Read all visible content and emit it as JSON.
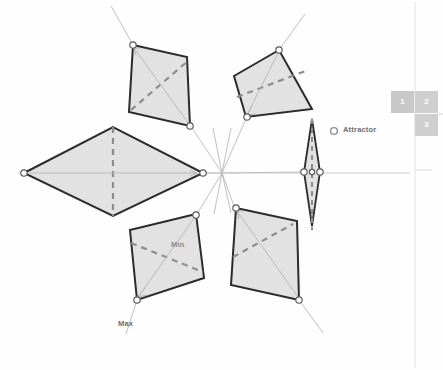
{
  "canvas": {
    "width": 443,
    "height": 370,
    "background": "#fefefe"
  },
  "legend": {
    "attractor_label": "Attractor",
    "attractor_icon": "circle-node-icon"
  },
  "annotations": {
    "min_label": "Min",
    "max_label": "Max"
  },
  "panel_boxes": {
    "items": [
      {
        "label": "1",
        "color": "#c8c8c8"
      },
      {
        "label": "2",
        "color": "#cfcfcf"
      },
      {
        "label": "3",
        "color": "#cfcfcf"
      }
    ]
  },
  "colors": {
    "panel_fill": "#e2e2e2",
    "panel_stroke": "#2b2b2b",
    "dashed_diagonal": "#8d8d8d",
    "thin_guide": "#b7b7b7",
    "node_stroke": "#555555",
    "node_fill": "#ffffff",
    "axis_line": "#c9c9c9",
    "ui_divider": "#e6e6e6",
    "text_gray": "#6e6e6e"
  },
  "geometry": {
    "center": {
      "x": 222,
      "y": 173
    },
    "symmetry": 5,
    "panels": [
      {
        "name": "panel-left-kite",
        "points": "24,173 113,127 203,173 113,216",
        "dashed": "113,127 113,216",
        "guide": "24,173 203,173",
        "arrow_at": "190,170"
      },
      {
        "name": "panel-top-left-square",
        "points": "133,45 186,58 190,126 130,112",
        "dashed": "133,112 190,58",
        "guide": "133,45 190,126",
        "arrow_at": "145,60"
      },
      {
        "name": "panel-top-right-rhombus",
        "points": "235,77 279,50 312,109 247,117",
        "dashed": "235,100 305,72",
        "guide": "247,117 279,50",
        "arrow_at": "262,98"
      },
      {
        "name": "panel-bottom-left-square",
        "points": "130,230 196,215 204,278 137,300",
        "dashed": "130,245 204,272",
        "guide": "196,215 137,300",
        "arrow_at": "150,285"
      },
      {
        "name": "panel-bottom-right-square",
        "points": "236,208 297,221 299,300 232,285",
        "dashed": "232,258 292,225",
        "guide": "236,208 299,300",
        "arrow_at": "246,222"
      },
      {
        "name": "panel-right-needle",
        "points": "312,120 320,172 312,225 304,172",
        "dashed": "312,120 312,225",
        "guide": "304,172 320,172",
        "arrow_at": "318,172"
      }
    ],
    "axis_horizontal_y": 173,
    "nodes": [
      {
        "x": 24,
        "y": 173
      },
      {
        "x": 203,
        "y": 173
      },
      {
        "x": 113,
        "y": 127
      },
      {
        "x": 113,
        "y": 216
      },
      {
        "x": 133,
        "y": 45
      },
      {
        "x": 190,
        "y": 126
      },
      {
        "x": 279,
        "y": 50
      },
      {
        "x": 247,
        "y": 117
      },
      {
        "x": 196,
        "y": 215
      },
      {
        "x": 137,
        "y": 300
      },
      {
        "x": 236,
        "y": 208
      },
      {
        "x": 299,
        "y": 300
      },
      {
        "x": 304,
        "y": 172
      },
      {
        "x": 320,
        "y": 172
      }
    ],
    "radial_rays": [
      "133,45 113,8",
      "279,50 303,16",
      "137,300 126,332",
      "299,300 322,331",
      "222,173 203,173",
      "222,173 190,126",
      "222,173 247,117",
      "222,173 196,215",
      "222,173 236,208",
      "222,173 304,172"
    ]
  }
}
